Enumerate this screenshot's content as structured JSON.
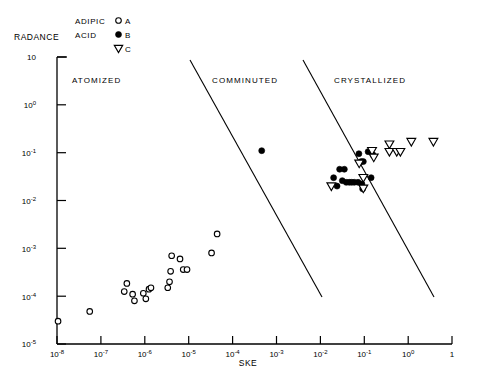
{
  "chart_data": {
    "type": "scatter",
    "title": "",
    "xlabel": "SKE",
    "ylabel": "RADANCE",
    "xscale": "log",
    "yscale": "log",
    "xlim": [
      1e-08,
      1
    ],
    "ylim": [
      1e-05,
      10
    ],
    "grid": false,
    "legend_position": "top",
    "xticks": [
      {
        "value": 1e-08,
        "label": "10",
        "exp": "-8"
      },
      {
        "value": 1e-07,
        "label": "10",
        "exp": "-7"
      },
      {
        "value": 1e-06,
        "label": "10",
        "exp": "-6"
      },
      {
        "value": 1e-05,
        "label": "10",
        "exp": "-5"
      },
      {
        "value": 0.0001,
        "label": "10",
        "exp": "-4"
      },
      {
        "value": 0.001,
        "label": "10",
        "exp": "-3"
      },
      {
        "value": 0.01,
        "label": "10",
        "exp": "-2"
      },
      {
        "value": 0.1,
        "label": "10",
        "exp": "-1"
      },
      {
        "value": 1.0,
        "label": "10",
        "exp": "0"
      },
      {
        "value": 1,
        "label": "1",
        "exp": ""
      }
    ],
    "yticks": [
      {
        "value": 10,
        "label": "10",
        "exp": ""
      },
      {
        "value": 1,
        "label": "10",
        "exp": "0"
      },
      {
        "value": 0.1,
        "label": "10",
        "exp": "-1"
      },
      {
        "value": 0.01,
        "label": "10",
        "exp": "-2"
      },
      {
        "value": 0.001,
        "label": "10",
        "exp": "-3"
      },
      {
        "value": 0.0001,
        "label": "10",
        "exp": "-4"
      },
      {
        "value": 1e-05,
        "label": "10",
        "exp": "-5"
      }
    ],
    "series": [
      {
        "name": "A",
        "marker": "open-circle",
        "legend_label": "A",
        "points": [
          [
            1.05e-08,
            3e-05
          ],
          [
            4.6e-08,
            4.8e-05
          ],
          [
            2.3e-07,
            0.000125
          ],
          [
            2.6e-07,
            0.000185
          ],
          [
            3.4e-07,
            0.00011
          ],
          [
            3.7e-07,
            8e-05
          ],
          [
            5.6e-07,
            0.000115
          ],
          [
            6.3e-07,
            8.8e-05
          ],
          [
            7.3e-07,
            0.00014
          ],
          [
            8e-07,
            0.00015
          ],
          [
            1.75e-06,
            0.00015
          ],
          [
            1.9e-06,
            0.0002
          ],
          [
            2e-06,
            0.00033
          ],
          [
            2.1e-06,
            0.0007
          ],
          [
            3.1e-06,
            0.0006
          ],
          [
            3.6e-06,
            0.00036
          ],
          [
            4.3e-06,
            0.00036
          ],
          [
            1.35e-05,
            0.0008
          ],
          [
            1.75e-05,
            0.002
          ]
        ]
      },
      {
        "name": "B",
        "marker": "filled-circle",
        "legend_label": "B",
        "points": [
          [
            0.00014,
            0.11
          ],
          [
            0.004,
            0.03
          ],
          [
            0.0047,
            0.02
          ],
          [
            0.0053,
            0.045
          ],
          [
            0.0066,
            0.045
          ],
          [
            0.006,
            0.026
          ],
          [
            0.0072,
            0.024
          ],
          [
            0.0083,
            0.024
          ],
          [
            0.0093,
            0.024
          ],
          [
            0.0105,
            0.024
          ],
          [
            0.0125,
            0.024
          ],
          [
            0.013,
            0.095
          ],
          [
            0.0145,
            0.065
          ],
          [
            0.016,
            0.065
          ],
          [
            0.015,
            0.022
          ],
          [
            0.0155,
            0.0175
          ],
          [
            0.02,
            0.105
          ],
          [
            0.023,
            0.03
          ],
          [
            0.025,
            0.09
          ]
        ]
      },
      {
        "name": "C",
        "marker": "down-triangle",
        "legend_label": "C",
        "points": [
          [
            0.0036,
            0.02
          ],
          [
            0.0132,
            0.06
          ],
          [
            0.016,
            0.03
          ],
          [
            0.016,
            0.018
          ],
          [
            0.024,
            0.11
          ],
          [
            0.026,
            0.08
          ],
          [
            0.054,
            0.15
          ],
          [
            0.054,
            0.105
          ],
          [
            0.076,
            0.105
          ],
          [
            0.09,
            0.105
          ],
          [
            0.15,
            0.17
          ],
          [
            0.42,
            0.17
          ]
        ]
      }
    ],
    "regions": [
      {
        "label": "ATOMIZED"
      },
      {
        "label": "COMMINUTED"
      },
      {
        "label": "CRYSTALLIZED"
      }
    ],
    "dividers": [
      {
        "name": "atomized-comminuted-divider"
      },
      {
        "name": "comminuted-crystallized-divider"
      }
    ]
  },
  "legend": {
    "group_line1": "ADIPIC",
    "group_line2": "ACID",
    "entries": [
      {
        "label": "A"
      },
      {
        "label": "B"
      },
      {
        "label": "C"
      }
    ]
  }
}
